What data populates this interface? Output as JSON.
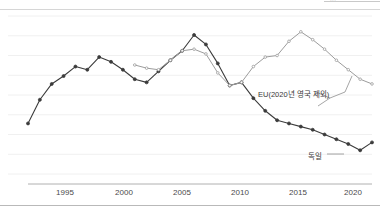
{
  "page": {
    "top_clipped_text": "...",
    "background": "#ffffff"
  },
  "chart_data": {
    "type": "line",
    "title": "",
    "subtitle": "",
    "xlabel": "",
    "ylabel": "",
    "grid": true,
    "grid_orientation": "horizontal",
    "legend": "inline-annotations",
    "xlim": [
      1991,
      2020
    ],
    "ylim": [
      0,
      100
    ],
    "xticks": [
      1995,
      2000,
      2005,
      2010,
      2015,
      2020
    ],
    "xticklabels": [
      "1995",
      "2000",
      "2005",
      "2010",
      "2015",
      "2020"
    ],
    "yticks": [],
    "yticklabels": [],
    "x": [
      1991,
      1992,
      1993,
      1994,
      1995,
      1996,
      1997,
      1998,
      1999,
      2000,
      2001,
      2002,
      2003,
      2004,
      2005,
      2006,
      2007,
      2008,
      2009,
      2010,
      2011,
      2012,
      2013,
      2014,
      2015,
      2016,
      2017,
      2018,
      2019,
      2020
    ],
    "series": [
      {
        "name": "독일",
        "label": "독일",
        "color": "#3b3b3b",
        "marker": "circle",
        "values": [
          32,
          47,
          57,
          62,
          68,
          66,
          74,
          71,
          66,
          60,
          58,
          65,
          72,
          78,
          88,
          82,
          70,
          56,
          58,
          48,
          40,
          34,
          32,
          30,
          28,
          25,
          22,
          19,
          15,
          20
        ]
      },
      {
        "name": "EU(2020년 영국 제외)",
        "label": "EU(2020년 영국 제외)",
        "color": "#9c9c9c",
        "marker": "circle",
        "values": [
          null,
          null,
          null,
          null,
          null,
          null,
          null,
          null,
          null,
          69,
          67,
          66,
          72,
          78,
          79,
          76,
          64,
          56,
          58,
          68,
          74,
          75,
          84,
          90,
          85,
          79,
          72,
          66,
          60,
          57
        ]
      }
    ],
    "annotations": [
      {
        "id": "eu-annotation",
        "text": "EU(2020년 영국 제외)",
        "points_to_series": "EU(2020년 영국 제외)",
        "x_px": 258,
        "y_px": 88
      },
      {
        "id": "germany-annotation",
        "text": "독일",
        "points_to_series": "독일",
        "x_px": 308,
        "y_px": 150
      }
    ]
  },
  "xaxis": {
    "ticks": [
      {
        "label": "1995",
        "x_px": 65
      },
      {
        "label": "2000",
        "x_px": 124
      },
      {
        "label": "2005",
        "x_px": 182
      },
      {
        "label": "2010",
        "x_px": 240
      },
      {
        "label": "2015",
        "x_px": 298
      },
      {
        "label": "2020",
        "x_px": 353
      }
    ]
  },
  "labels": {
    "eu": "EU(2020년 영국 제외)",
    "germany": "독일"
  },
  "colors": {
    "germany_line": "#3b3b3b",
    "eu_line": "#9c9c9c",
    "gridline": "#f0f0f0",
    "axis": "#b0b0b0",
    "text": "#4a4a4a"
  }
}
